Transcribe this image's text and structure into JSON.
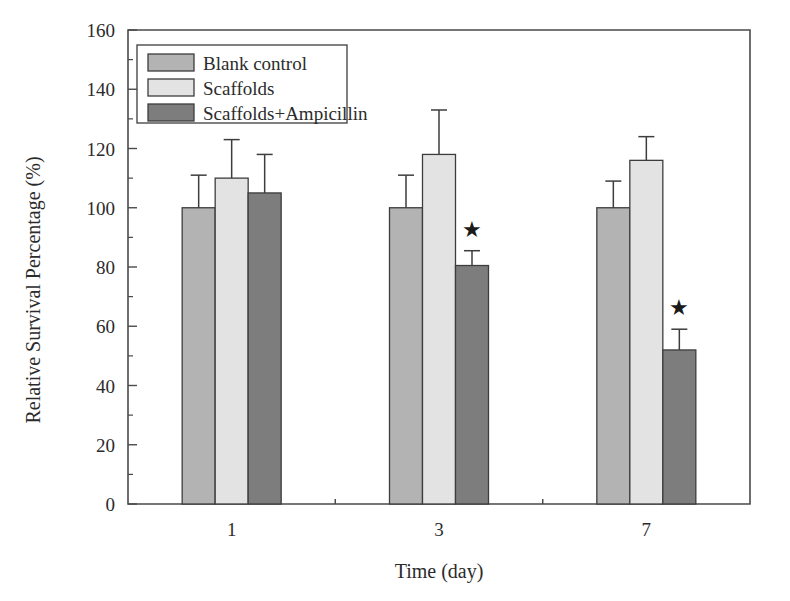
{
  "chart_data": {
    "type": "bar",
    "title": "",
    "xlabel": "Time (day)",
    "ylabel": "Relative Survival Percentage (%)",
    "categories": [
      "1",
      "3",
      "7"
    ],
    "ylim": [
      0,
      160
    ],
    "ytick_step": 20,
    "yticks": [
      "0",
      "20",
      "40",
      "60",
      "80",
      "100",
      "120",
      "140",
      "160"
    ],
    "minor_ticks": true,
    "grid": false,
    "legend_position": "top-left",
    "series": [
      {
        "name": "Blank control",
        "color": "#b3b3b3",
        "values": [
          100,
          100,
          100
        ],
        "errors": [
          11,
          11,
          9
        ],
        "significance": [
          "",
          "",
          ""
        ]
      },
      {
        "name": "Scaffolds",
        "color": "#e3e3e3",
        "values": [
          110,
          118,
          116
        ],
        "errors": [
          13,
          15,
          8
        ],
        "significance": [
          "",
          "",
          ""
        ]
      },
      {
        "name": "Scaffolds+Ampicillin",
        "color": "#7d7d7d",
        "values": [
          105,
          80.5,
          52
        ],
        "errors": [
          13,
          5,
          7
        ],
        "significance": [
          "",
          "★",
          "★"
        ]
      }
    ],
    "annotations": [
      {
        "symbol": "★",
        "group": "3",
        "series": "Scaffolds+Ampicillin"
      },
      {
        "symbol": "★",
        "group": "7",
        "series": "Scaffolds+Ampicillin"
      }
    ],
    "colors": {
      "blank_control": "#b3b3b3",
      "scaffolds": "#e3e3e3",
      "scaffolds_ampicillin": "#7d7d7d",
      "axis": "#4a4a4a",
      "text": "#2b2b2b",
      "background": "#ffffff"
    }
  },
  "axis": {
    "y_title": "Relative Survival Percentage (%)",
    "x_title": "Time (day)",
    "y_ticks": [
      "160",
      "140",
      "120",
      "100",
      "80",
      "60",
      "40",
      "20",
      "0"
    ],
    "x_ticks": [
      "1",
      "3",
      "7"
    ]
  },
  "legend": {
    "items": [
      {
        "label": "Blank control"
      },
      {
        "label": "Scaffolds"
      },
      {
        "label": "Scaffolds+Ampicillin"
      }
    ]
  }
}
